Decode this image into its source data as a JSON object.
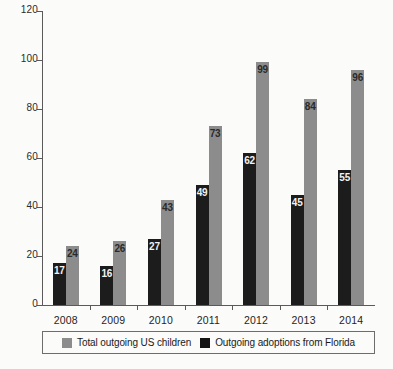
{
  "chart_data": {
    "type": "bar",
    "title": "",
    "subtitle": "",
    "xlabel": "",
    "ylabel": "",
    "categories": [
      "2008",
      "2009",
      "2010",
      "2011",
      "2012",
      "2013",
      "2014"
    ],
    "series": [
      {
        "name": "Outgoing adoptions from Florida",
        "color": "#1c1c1c",
        "values": [
          17,
          16,
          27,
          49,
          62,
          45,
          55
        ]
      },
      {
        "name": "Total outgoing US children",
        "color": "#8c8c8c",
        "values": [
          24,
          26,
          43,
          73,
          99,
          84,
          96
        ]
      }
    ],
    "ylim": [
      0,
      120
    ],
    "yticks": [
      0,
      20,
      40,
      60,
      80,
      100,
      120
    ],
    "ytick_labels": [
      "0",
      "20",
      "40",
      "60",
      "80",
      "100",
      "120"
    ],
    "grid": false,
    "legend_position": "bottom",
    "legend_order": [
      "Total outgoing US children",
      "Outgoing adoptions from Florida"
    ],
    "data_labels_shown": true
  },
  "legend": {
    "entries": [
      {
        "label": "Total outgoing US children",
        "swatch": "gray"
      },
      {
        "label": "Outgoing adoptions from Florida",
        "swatch": "black"
      }
    ]
  },
  "caption": {
    "text": ""
  }
}
